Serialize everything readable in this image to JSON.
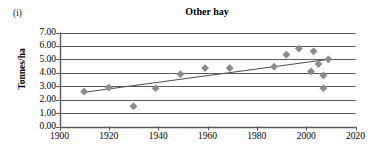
{
  "figure": {
    "panel_label": "(i)",
    "title": "Other hay"
  },
  "axes": {
    "y_title": "Tonnes/ha",
    "y_ticks": [
      "0.00",
      "1.00",
      "2.00",
      "3.00",
      "4.00",
      "5.00",
      "6.00",
      "7.00"
    ],
    "x_ticks": [
      "1900",
      "1920",
      "1940",
      "1960",
      "1980",
      "2000",
      "2020"
    ]
  },
  "colors": {
    "marker": "#8a8a8a",
    "gridline": "#595959",
    "axis": "#595959",
    "trendline": "#4d4d4d",
    "text": "#000000",
    "background": "#ffffff"
  },
  "chart_data": {
    "type": "scatter",
    "title": "Other hay",
    "xlabel": "",
    "ylabel": "Tonnes/ha",
    "xlim": [
      1900,
      2020
    ],
    "ylim": [
      0,
      7
    ],
    "ytick_step": 1,
    "xtick_step": 20,
    "grid": true,
    "legend": false,
    "series": [
      {
        "name": "Other hay yield",
        "marker": "diamond",
        "points": [
          {
            "x": 1910,
            "y": 2.6
          },
          {
            "x": 1920,
            "y": 2.9
          },
          {
            "x": 1930,
            "y": 1.5
          },
          {
            "x": 1939,
            "y": 2.85
          },
          {
            "x": 1949,
            "y": 3.9
          },
          {
            "x": 1959,
            "y": 4.35
          },
          {
            "x": 1969,
            "y": 4.35
          },
          {
            "x": 1987,
            "y": 4.45
          },
          {
            "x": 1992,
            "y": 5.35
          },
          {
            "x": 1997,
            "y": 5.8
          },
          {
            "x": 2002,
            "y": 4.1
          },
          {
            "x": 2003,
            "y": 5.6
          },
          {
            "x": 2005,
            "y": 4.65
          },
          {
            "x": 2007,
            "y": 3.8
          },
          {
            "x": 2007,
            "y": 2.85
          },
          {
            "x": 2009,
            "y": 5.0
          }
        ]
      },
      {
        "name": "Linear trend",
        "type": "line",
        "points": [
          {
            "x": 1910,
            "y": 2.55
          },
          {
            "x": 2009,
            "y": 5.0
          }
        ]
      }
    ]
  }
}
